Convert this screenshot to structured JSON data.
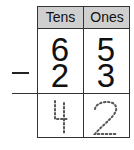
{
  "table": {
    "headers": [
      "Tens",
      "Ones"
    ],
    "minuend": {
      "tens": "6",
      "ones": "5"
    },
    "subtrahend": {
      "tens": "2",
      "ones": "3"
    },
    "operator": "minus",
    "answer": {
      "tens": "4",
      "ones": "2",
      "style": "dotted-tracing"
    }
  },
  "colors": {
    "header_bg": "#cfcfcf",
    "border": "#333333"
  }
}
